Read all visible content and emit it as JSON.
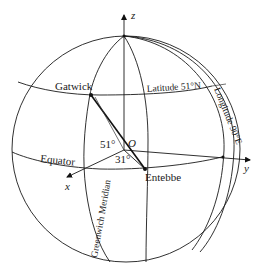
{
  "figure": {
    "axes": {
      "z": "z",
      "x": "x",
      "y": "y",
      "origin": "O"
    },
    "points": {
      "gatwick": "Gatwick",
      "entebbe": "Entebbe"
    },
    "circles": {
      "latitude": "Latitude 51°N",
      "equator": "Equator",
      "greenwich": "Greenwich Meridian",
      "longitude": "Longitude 90°E"
    },
    "angles": {
      "latitude_angle": "51°",
      "longitude_angle": "31°"
    }
  }
}
